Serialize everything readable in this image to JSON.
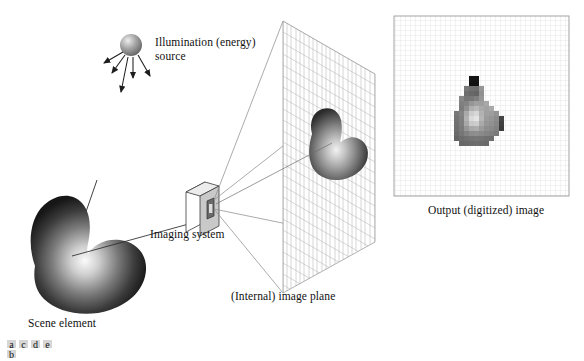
{
  "figure": {
    "background": "#ffffff",
    "width": 584,
    "height": 361
  },
  "labels": {
    "illumination": "Illumination (energy)\nsource",
    "imaging_system": "Imaging system",
    "scene_element": "Scene element",
    "image_plane": "(Internal) image plane",
    "output_image": "Output (digitized) image"
  },
  "panel_letters": {
    "stacked": [
      "a",
      "b"
    ],
    "inline": [
      "c",
      "d",
      "e"
    ],
    "box_fill": "#d6d6d6"
  },
  "illumination_source": {
    "icon": "sphere-light-source",
    "center_x": 131,
    "center_y": 45,
    "radius": 11,
    "highlight": "#e8e8e8",
    "shade": "#6a6a6a",
    "ray_count": 5
  },
  "scene_element": {
    "icon": "shaded-blob",
    "highlight": "#f2f2f2",
    "shade": "#1a1a1a"
  },
  "imaging_system": {
    "icon": "camera-box",
    "face_fill": "#c9c9c9",
    "top_fill": "#e6e6e6",
    "side_fill": "#ffffff",
    "aperture_fill": "#5a5a5a"
  },
  "image_plane": {
    "icon": "perspective-grid-plane",
    "grid_color": "#b9b9b9",
    "grid_cols": 22,
    "grid_rows": 26,
    "corners": {
      "top_left": [
        283,
        21
      ],
      "top_right": [
        375,
        74
      ],
      "bottom_right": [
        375,
        242
      ],
      "bottom_left": [
        283,
        293
      ]
    }
  },
  "projection_rays": {
    "color": "#8a8a8a",
    "count": 4
  },
  "output_grid": {
    "frame_color": "#9a9a9a",
    "grid_color": "#d9d9d9",
    "x": 394,
    "y": 16,
    "width": 175,
    "height": 180,
    "cell": 5,
    "cols": 35,
    "rows": 36
  },
  "chart_data": {
    "type": "heatmap",
    "title": "Output (digitized) image",
    "xlabel": "",
    "ylabel": "",
    "grid": true,
    "cell_size": 5,
    "legend": "none",
    "note": "Pixelated (sampled and quantized) version of the blob in the internal image plane; values are 8-bit gray levels.",
    "origin_cell": [
      12,
      12
    ],
    "gray_levels": [
      [
        255,
        255,
        255,
        20,
        20,
        255,
        255,
        255,
        255,
        255,
        255,
        255
      ],
      [
        255,
        255,
        255,
        18,
        18,
        255,
        255,
        255,
        255,
        255,
        255,
        255
      ],
      [
        255,
        255,
        120,
        112,
        110,
        150,
        255,
        255,
        255,
        255,
        255,
        255
      ],
      [
        255,
        255,
        110,
        104,
        100,
        145,
        255,
        255,
        255,
        255,
        255,
        255
      ],
      [
        255,
        135,
        118,
        120,
        128,
        150,
        255,
        255,
        255,
        255,
        255,
        255
      ],
      [
        255,
        128,
        132,
        150,
        160,
        158,
        168,
        255,
        255,
        255,
        255,
        255
      ],
      [
        255,
        124,
        145,
        175,
        185,
        170,
        162,
        170,
        255,
        255,
        255,
        255
      ],
      [
        120,
        132,
        170,
        205,
        215,
        178,
        160,
        158,
        148,
        255,
        255,
        255
      ],
      [
        115,
        128,
        178,
        218,
        228,
        182,
        155,
        150,
        140,
        70,
        255,
        255
      ],
      [
        112,
        126,
        168,
        200,
        205,
        170,
        150,
        145,
        135,
        64,
        255,
        255
      ],
      [
        110,
        122,
        150,
        168,
        172,
        155,
        142,
        138,
        130,
        60,
        255,
        255
      ],
      [
        105,
        118,
        130,
        140,
        142,
        138,
        132,
        128,
        122,
        255,
        255,
        255
      ],
      [
        100,
        108,
        112,
        116,
        118,
        116,
        112,
        110,
        255,
        255,
        255,
        255
      ],
      [
        255,
        104,
        106,
        108,
        110,
        108,
        106,
        255,
        255,
        255,
        255,
        255
      ]
    ]
  }
}
